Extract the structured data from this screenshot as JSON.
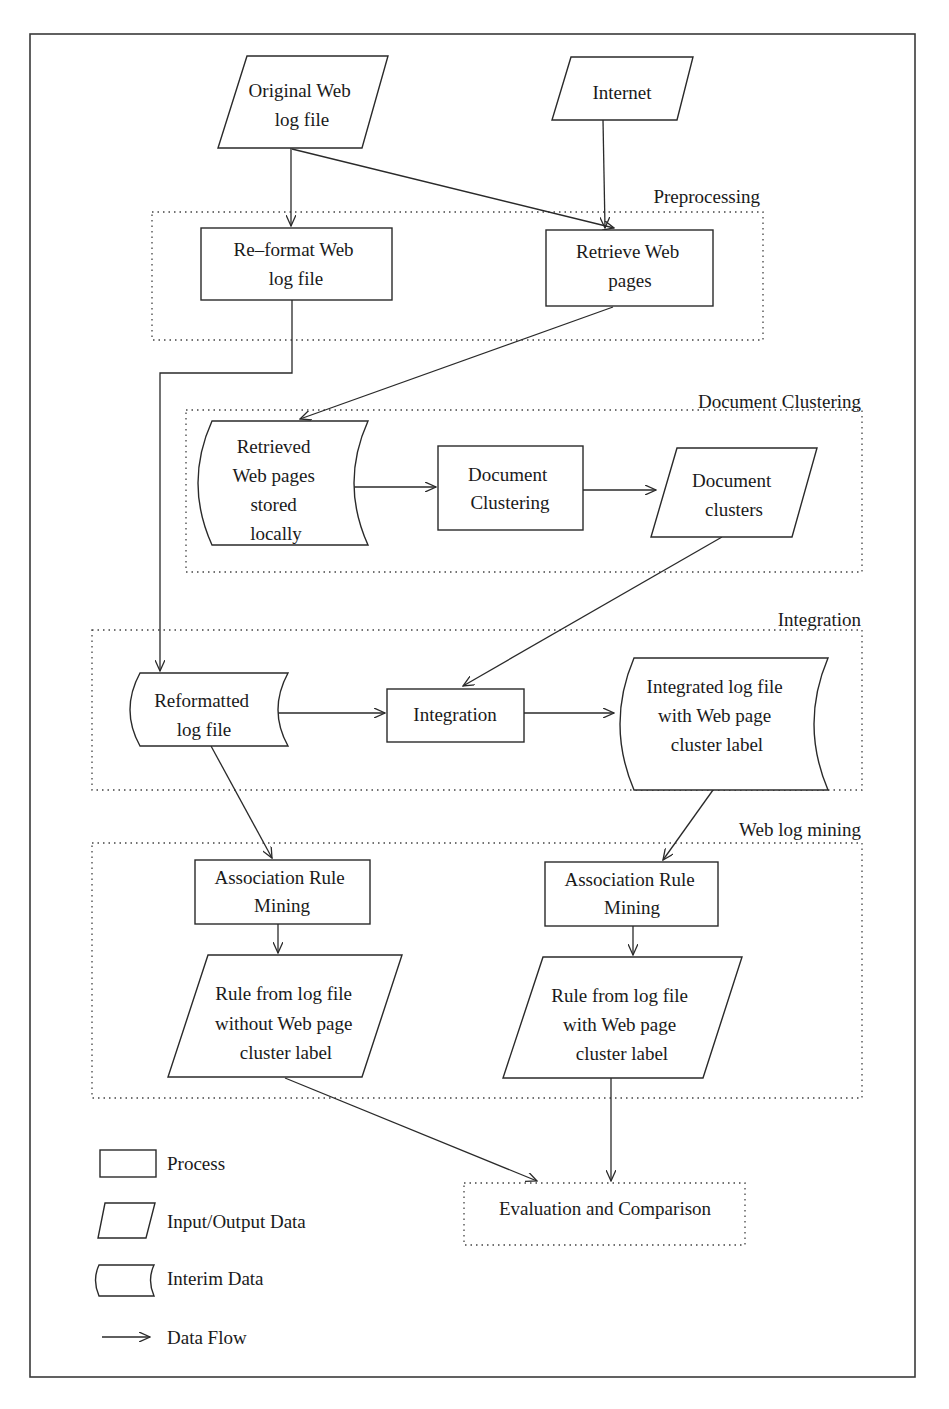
{
  "diagram": {
    "type": "flowchart",
    "sections": {
      "preprocessing": {
        "label": "Preprocessing"
      },
      "document_clustering": {
        "label": "Document Clustering"
      },
      "integration": {
        "label": "Integration"
      },
      "web_log_mining": {
        "label": "Web log mining"
      }
    },
    "nodes": {
      "original_log": {
        "kind": "input-output",
        "lines": [
          "Original Web",
          "log file"
        ]
      },
      "internet": {
        "kind": "input-output",
        "lines": [
          "Internet"
        ]
      },
      "reformat": {
        "kind": "process",
        "lines": [
          "Re–format Web",
          "log file"
        ]
      },
      "retrieve": {
        "kind": "process",
        "lines": [
          "Retrieve Web",
          "pages"
        ]
      },
      "retrieved_local": {
        "kind": "interim",
        "lines": [
          "Retrieved",
          "Web pages",
          "stored",
          "locally"
        ]
      },
      "doc_clustering": {
        "kind": "process",
        "lines": [
          "Document",
          "Clustering"
        ]
      },
      "doc_clusters": {
        "kind": "input-output",
        "lines": [
          "Document",
          "clusters"
        ]
      },
      "reformatted_log": {
        "kind": "interim",
        "lines": [
          "Reformatted",
          "log file"
        ]
      },
      "integration": {
        "kind": "process",
        "lines": [
          "Integration"
        ]
      },
      "integrated_log": {
        "kind": "interim",
        "lines": [
          "Integrated log file",
          "with Web page",
          "cluster label"
        ]
      },
      "arm_left": {
        "kind": "process",
        "lines": [
          "Association Rule",
          "Mining"
        ]
      },
      "arm_right": {
        "kind": "process",
        "lines": [
          "Association Rule",
          "Mining"
        ]
      },
      "rule_without": {
        "kind": "input-output",
        "lines": [
          "Rule from log file",
          "without Web page",
          "cluster label"
        ]
      },
      "rule_with": {
        "kind": "input-output",
        "lines": [
          "Rule from log file",
          "with Web page",
          "cluster label"
        ]
      },
      "evaluation": {
        "kind": "dotted-box",
        "lines": [
          "Evaluation and Comparison"
        ]
      }
    },
    "edges": [
      [
        "original_log",
        "reformat"
      ],
      [
        "original_log",
        "retrieve"
      ],
      [
        "internet",
        "retrieve"
      ],
      [
        "retrieve",
        "retrieved_local"
      ],
      [
        "reformat",
        "reformatted_log"
      ],
      [
        "retrieved_local",
        "doc_clustering"
      ],
      [
        "doc_clustering",
        "doc_clusters"
      ],
      [
        "doc_clusters",
        "integration"
      ],
      [
        "reformatted_log",
        "integration"
      ],
      [
        "integration",
        "integrated_log"
      ],
      [
        "reformatted_log",
        "arm_left"
      ],
      [
        "integrated_log",
        "arm_right"
      ],
      [
        "arm_left",
        "rule_without"
      ],
      [
        "arm_right",
        "rule_with"
      ],
      [
        "rule_without",
        "evaluation"
      ],
      [
        "rule_with",
        "evaluation"
      ]
    ],
    "legend": {
      "process": "Process",
      "io": "Input/Output Data",
      "interim": "Interim Data",
      "flow": "Data Flow"
    }
  }
}
